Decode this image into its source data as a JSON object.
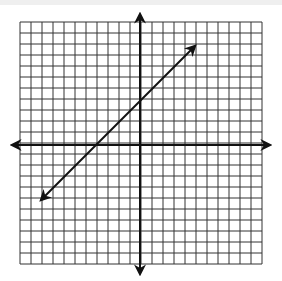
{
  "figure": {
    "type": "coordinate-grid",
    "grid": {
      "columns": 22,
      "rows": 22,
      "cell_px": 11,
      "left": 20,
      "top": 22,
      "color": "#333333"
    },
    "axes": {
      "x_axis_y": 145,
      "y_axis_x": 140,
      "color": "#111111"
    },
    "line": {
      "equation": "y = x + 4",
      "slope": 1,
      "y_intercept": 4,
      "start": [
        -9,
        -5
      ],
      "end": [
        5,
        9
      ],
      "color": "#111111"
    }
  }
}
